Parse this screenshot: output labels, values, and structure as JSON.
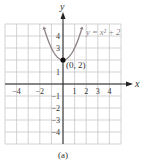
{
  "chart_data": {
    "type": "line",
    "title": "",
    "equation_label": "y = x² + 2",
    "xlabel": "x",
    "ylabel": "y",
    "xlim": [
      -5,
      5
    ],
    "ylim": [
      -5,
      5
    ],
    "grid": true,
    "x_ticks": [
      -4,
      -2,
      1,
      2,
      3,
      4
    ],
    "y_ticks": [
      4,
      3,
      1,
      -1,
      -2,
      -3,
      -4
    ],
    "series": [
      {
        "name": "y = x^2 + 2",
        "x": [
          -1.6,
          -1.5,
          -1.25,
          -1,
          -0.75,
          -0.5,
          -0.25,
          0,
          0.25,
          0.5,
          0.75,
          1,
          1.25,
          1.5,
          1.6
        ],
        "y": [
          4.56,
          4.25,
          3.5625,
          3,
          2.5625,
          2.25,
          2.0625,
          2,
          2.0625,
          2.25,
          2.5625,
          3,
          3.5625,
          4.25,
          4.56
        ],
        "color": "#8a7f86"
      }
    ],
    "annotations": [
      {
        "text": "(0, 2)",
        "x": 0,
        "y": 2,
        "marker": "filled-circle"
      }
    ],
    "caption": "(a)"
  },
  "colors": {
    "grid": "#c8c8c8",
    "axis": "#222222",
    "curve": "#8a7f86",
    "text": "#333333"
  }
}
